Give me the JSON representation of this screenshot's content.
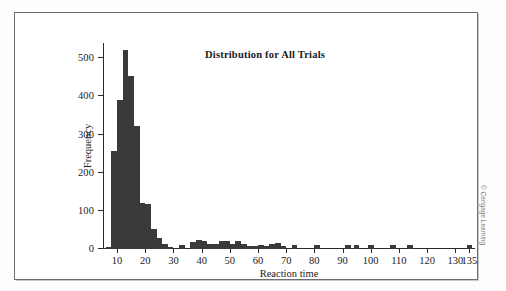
{
  "figure": {
    "credit": "© Cengage Learning"
  },
  "chart_data": {
    "type": "bar",
    "title": "Distribution for All Trials",
    "xlabel": "Reaction time",
    "ylabel": "Frequency",
    "xlim": [
      5,
      137
    ],
    "ylim": [
      0,
      540
    ],
    "grid": false,
    "legend": null,
    "bar_color": "#3a3a3c",
    "axis_color": "#2a2a2e",
    "bin_width": 2,
    "xticks": [
      10,
      20,
      30,
      40,
      50,
      60,
      70,
      80,
      90,
      100,
      110,
      120,
      130,
      135
    ],
    "yticks": [
      0,
      100,
      200,
      300,
      400,
      500
    ],
    "bins": [
      {
        "x": 7,
        "value": 6
      },
      {
        "x": 9,
        "value": 258
      },
      {
        "x": 11,
        "value": 390
      },
      {
        "x": 13,
        "value": 522
      },
      {
        "x": 15,
        "value": 454
      },
      {
        "x": 17,
        "value": 322
      },
      {
        "x": 19,
        "value": 120
      },
      {
        "x": 21,
        "value": 118
      },
      {
        "x": 23,
        "value": 52
      },
      {
        "x": 25,
        "value": 28
      },
      {
        "x": 27,
        "value": 14
      },
      {
        "x": 29,
        "value": 6
      },
      {
        "x": 33,
        "value": 10
      },
      {
        "x": 37,
        "value": 18
      },
      {
        "x": 39,
        "value": 24
      },
      {
        "x": 41,
        "value": 22
      },
      {
        "x": 43,
        "value": 14
      },
      {
        "x": 45,
        "value": 13
      },
      {
        "x": 47,
        "value": 20
      },
      {
        "x": 49,
        "value": 20
      },
      {
        "x": 51,
        "value": 13
      },
      {
        "x": 53,
        "value": 22
      },
      {
        "x": 55,
        "value": 12
      },
      {
        "x": 57,
        "value": 8
      },
      {
        "x": 59,
        "value": 9
      },
      {
        "x": 61,
        "value": 11
      },
      {
        "x": 63,
        "value": 8
      },
      {
        "x": 65,
        "value": 13
      },
      {
        "x": 67,
        "value": 16
      },
      {
        "x": 69,
        "value": 7
      },
      {
        "x": 73,
        "value": 11
      },
      {
        "x": 81,
        "value": 10
      },
      {
        "x": 92,
        "value": 11
      },
      {
        "x": 95,
        "value": 11
      },
      {
        "x": 100,
        "value": 11
      },
      {
        "x": 108,
        "value": 10
      },
      {
        "x": 114,
        "value": 10
      },
      {
        "x": 135,
        "value": 11
      }
    ]
  }
}
